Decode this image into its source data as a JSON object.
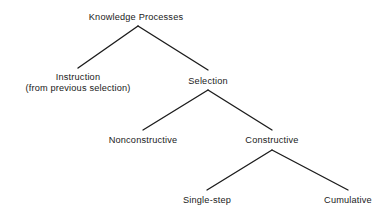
{
  "diagram": {
    "type": "tree",
    "background_color": "#ffffff",
    "text_color": "#1a1a1a",
    "edge_color": "#1c1c1c",
    "nodes": [
      {
        "id": "knowledge-processes",
        "label": "Knowledge Processes",
        "lines": [
          "Knowledge Processes"
        ],
        "level": 0,
        "x": 136,
        "y": 12
      },
      {
        "id": "instruction",
        "label": "Instruction (from previous selection)",
        "lines": [
          "Instruction",
          "(from previous selection)"
        ],
        "level": 1,
        "x": 78,
        "y": 72
      },
      {
        "id": "selection",
        "label": "Selection",
        "lines": [
          "Selection"
        ],
        "level": 1,
        "x": 208,
        "y": 76
      },
      {
        "id": "nonconstructive",
        "label": "Nonconstructive",
        "lines": [
          "Nonconstructive"
        ],
        "level": 2,
        "x": 143,
        "y": 135
      },
      {
        "id": "constructive",
        "label": "Constructive",
        "lines": [
          "Constructive"
        ],
        "level": 2,
        "x": 272,
        "y": 135
      },
      {
        "id": "single-step",
        "label": "Single-step",
        "lines": [
          "Single-step"
        ],
        "level": 3,
        "x": 207,
        "y": 195
      },
      {
        "id": "cumulative",
        "label": "Cumulative",
        "lines": [
          "Cumulative"
        ],
        "level": 3,
        "x": 348,
        "y": 195
      }
    ],
    "edges": [
      {
        "from": "knowledge-processes",
        "to": "instruction",
        "x1": 138,
        "y1": 26,
        "x2": 78,
        "y2": 68
      },
      {
        "from": "knowledge-processes",
        "to": "selection",
        "x1": 138,
        "y1": 26,
        "x2": 208,
        "y2": 70
      },
      {
        "from": "selection",
        "to": "nonconstructive",
        "x1": 208,
        "y1": 90,
        "x2": 143,
        "y2": 130
      },
      {
        "from": "selection",
        "to": "constructive",
        "x1": 208,
        "y1": 90,
        "x2": 272,
        "y2": 130
      },
      {
        "from": "constructive",
        "to": "single-step",
        "x1": 272,
        "y1": 150,
        "x2": 207,
        "y2": 190
      },
      {
        "from": "constructive",
        "to": "cumulative",
        "x1": 272,
        "y1": 150,
        "x2": 348,
        "y2": 190
      }
    ]
  }
}
